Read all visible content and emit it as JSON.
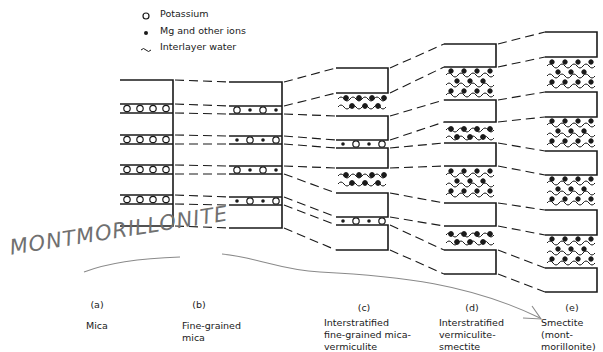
{
  "legend": {
    "items": [
      {
        "symbol": "open-circle",
        "label": "Potassium"
      },
      {
        "symbol": "filled-dot",
        "label": "Mg and other ions"
      },
      {
        "symbol": "wave",
        "label": "Interlayer water"
      }
    ]
  },
  "columns": [
    {
      "letter": "(a)",
      "label": "Mica"
    },
    {
      "letter": "(b)",
      "label": "Fine-grained\nmica"
    },
    {
      "letter": "(c)",
      "label": "Interstratified\nfine-grained mica-\nvermiculite"
    },
    {
      "letter": "(d)",
      "label": "Interstratified\nvermiculite-\nsmectite"
    },
    {
      "letter": "(e)",
      "label": "Smectite\n(mont-\nmorillonite)"
    }
  ],
  "annotation": {
    "handwritten_text": "MONTMORILLONITE",
    "arrow_target": "(e)"
  },
  "colors": {
    "ink": "#1a1a1a",
    "pencil": "#8a8a8a",
    "background": "#ffffff"
  }
}
